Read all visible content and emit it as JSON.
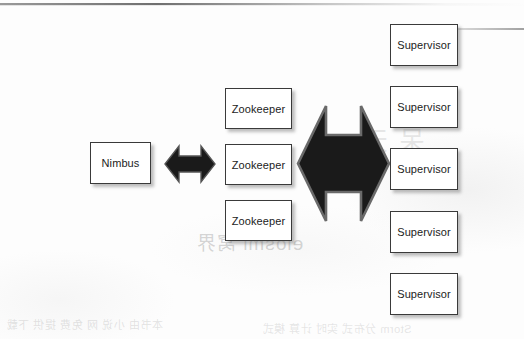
{
  "diagram": {
    "background_color": "#fdfdfd",
    "node_fill": "#ffffff",
    "node_border": "#3a3a3a",
    "arrow_fill": "#1a1a1a",
    "nimbus": {
      "label": "Nimbus",
      "x": 90,
      "y": 142,
      "w": 61,
      "h": 42
    },
    "zookeepers": [
      {
        "label": "Zookeeper",
        "x": 225,
        "y": 88,
        "w": 67,
        "h": 41
      },
      {
        "label": "Zookeeper",
        "x": 225,
        "y": 144,
        "w": 67,
        "h": 41
      },
      {
        "label": "Zookeeper",
        "x": 225,
        "y": 200,
        "w": 67,
        "h": 41
      }
    ],
    "supervisors": [
      {
        "label": "Supervisor",
        "x": 390,
        "y": 24,
        "w": 68,
        "h": 42
      },
      {
        "label": "Supervisor",
        "x": 390,
        "y": 86,
        "w": 68,
        "h": 42
      },
      {
        "label": "Supervisor",
        "x": 390,
        "y": 148,
        "w": 68,
        "h": 42
      },
      {
        "label": "Supervisor",
        "x": 390,
        "y": 211,
        "w": 68,
        "h": 42
      },
      {
        "label": "Supervisor",
        "x": 390,
        "y": 273,
        "w": 68,
        "h": 42
      }
    ],
    "arrows": [
      {
        "name": "nimbus-zookeeper-arrow",
        "kind": "double-headed-horizontal",
        "x": 164,
        "y": 144,
        "w": 52,
        "h": 40
      },
      {
        "name": "zookeeper-supervisor-arrow",
        "kind": "double-headed-horizontal",
        "x": 296,
        "y": 104,
        "w": 95,
        "h": 119
      }
    ],
    "bleed_through": {
      "line_1": "elosmi 窝界",
      "line_2": "呆 天",
      "line_3": "本书由 小说 网 免费 提供 下载",
      "line_4": "Storm 分布式 实时 计算 模式"
    }
  }
}
